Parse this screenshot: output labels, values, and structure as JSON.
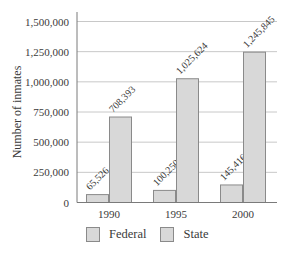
{
  "chart_data": {
    "type": "bar",
    "title": "",
    "xlabel": "",
    "ylabel": "Number of inmates",
    "categories": [
      "1990",
      "1995",
      "2000"
    ],
    "series": [
      {
        "name": "Federal",
        "values": [
          65526,
          100250,
          145416
        ],
        "labels": [
          "65,526",
          "100,250",
          "145,416"
        ],
        "color": "#d8d8d8"
      },
      {
        "name": "State",
        "values": [
          708393,
          1025624,
          1245845
        ],
        "labels": [
          "708,393",
          "1,025,624",
          "1,245,845"
        ],
        "color": "#d8d8d8"
      }
    ],
    "ylim": [
      0,
      1500000
    ],
    "yticks": [
      0,
      250000,
      500000,
      750000,
      1000000,
      1250000,
      1500000
    ],
    "ytick_labels": [
      "0",
      "250,000",
      "500,000",
      "750,000",
      "1,000,000",
      "1,250,000",
      "1,500,000"
    ],
    "grid": true,
    "legend_position": "bottom",
    "bar_border_color": "#8a8a8a",
    "grid_color": "#c8c8c8"
  },
  "legend": {
    "items": [
      {
        "label": "Federal"
      },
      {
        "label": "State"
      }
    ]
  }
}
